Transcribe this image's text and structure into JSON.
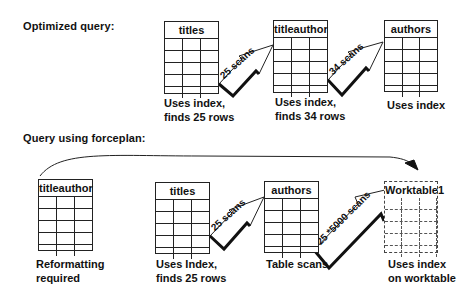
{
  "sections": {
    "optimized": {
      "label": "Optimized query:"
    },
    "forceplan": {
      "label": "Query using forceplan:"
    }
  },
  "optimized": {
    "tables": [
      {
        "name": "titles",
        "caption_line1": "Uses index,",
        "caption_line2": "finds 25 rows"
      },
      {
        "name": "titleauthor",
        "caption_line1": "Uses index,",
        "caption_line2": "finds 34 rows"
      },
      {
        "name": "authors",
        "caption_line1": "Uses index",
        "caption_line2": ""
      }
    ],
    "arrows": [
      {
        "label": "25 scans"
      },
      {
        "label": "34 scans"
      }
    ]
  },
  "forceplan": {
    "tables": [
      {
        "name": "titleauthor",
        "caption_line1": "Reformatting",
        "caption_line2": "required"
      },
      {
        "name": "titles",
        "caption_line1": "Uses Index,",
        "caption_line2": "finds 25 rows"
      },
      {
        "name": "authors",
        "caption_line1": "Table scans",
        "caption_line2": ""
      },
      {
        "name": "Worktable1",
        "caption_line1": "Uses index",
        "caption_line2": "on worktable"
      }
    ],
    "arrows": [
      {
        "label": "25 scans"
      },
      {
        "label": "25 *5000 scans"
      }
    ]
  },
  "colors": {
    "line": "#222222",
    "background": "#ffffff",
    "text": "#111111"
  }
}
